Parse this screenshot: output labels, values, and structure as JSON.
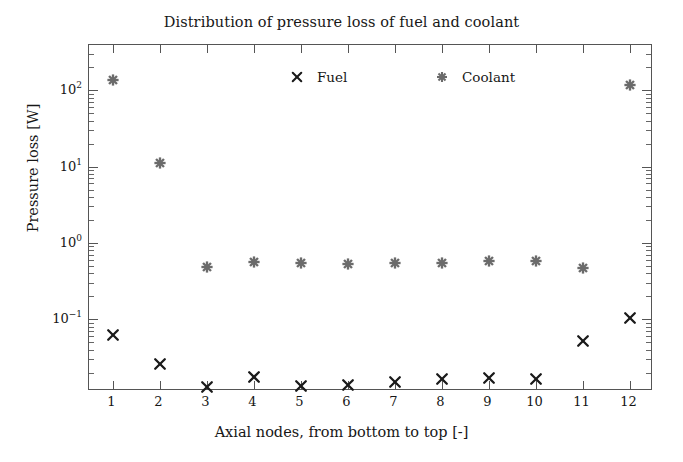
{
  "chart_data": {
    "type": "scatter",
    "title": "Distribution of pressure loss of fuel and coolant",
    "xlabel": "Axial nodes, from bottom to top [-]",
    "ylabel": "Pressure loss [W]",
    "yscale": "log",
    "ylim": [
      0.0115,
      390
    ],
    "xlim": [
      0.5,
      12.5
    ],
    "grid": false,
    "legend_position": "top-center-inside",
    "categories": [
      1,
      2,
      3,
      4,
      5,
      6,
      7,
      8,
      9,
      10,
      11,
      12
    ],
    "x_tick_labels": [
      "1",
      "2",
      "3",
      "4",
      "5",
      "6",
      "7",
      "8",
      "9",
      "10",
      "11",
      "12"
    ],
    "y_tick_labels": [
      "10-1",
      "100",
      "101",
      "102"
    ],
    "y_tick_values": [
      0.1,
      1,
      10,
      100
    ],
    "series": [
      {
        "name": "Fuel",
        "marker": "x",
        "color": "#1a1a1a",
        "values": [
          0.062,
          0.026,
          0.0131,
          0.0175,
          0.0133,
          0.0136,
          0.0152,
          0.0164,
          0.0172,
          0.0165,
          0.052,
          0.103
        ]
      },
      {
        "name": "Coolant",
        "marker": "asterisk",
        "color": "#6b6b6b",
        "values": [
          135,
          11.2,
          0.48,
          0.565,
          0.54,
          0.535,
          0.545,
          0.55,
          0.575,
          0.575,
          0.475,
          118
        ]
      }
    ]
  },
  "legend": {
    "entries": [
      {
        "label": "Fuel",
        "marker": "x-marker-icon"
      },
      {
        "label": "Coolant",
        "marker": "asterisk-marker-icon"
      }
    ]
  },
  "colors": {
    "fuel": "#1a1a1a",
    "coolant": "#6b6b6b",
    "axis": "#555555",
    "background": "#ffffff",
    "text": "#171717"
  }
}
